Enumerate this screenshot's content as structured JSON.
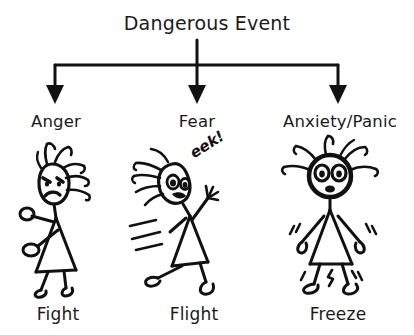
{
  "diagram": {
    "title": "Dangerous Event",
    "background_color": "#ffffff",
    "ink_color": "#111111",
    "branches": [
      {
        "emotion": "Anger",
        "response": "Fight",
        "figure": "angry-stick-figure-with-fists",
        "arrow_x": 55
      },
      {
        "emotion": "Fear",
        "response": "Flight",
        "figure": "running-stick-figure-with-speed-lines",
        "exclamation": "eek!",
        "arrow_x": 197
      },
      {
        "emotion": "Anxiety/Panic",
        "response": "Freeze",
        "figure": "trembling-stick-figure-with-wide-eyes",
        "arrow_x": 338
      }
    ]
  }
}
